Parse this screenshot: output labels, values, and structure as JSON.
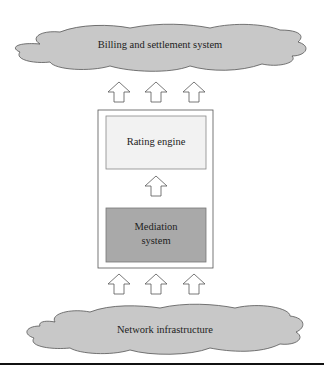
{
  "diagram": {
    "top_cloud": {
      "label": "Billing and settlement system",
      "fill": "#c8c8c8"
    },
    "rating_engine": {
      "label": "Rating engine",
      "fill": "#f2f2f2"
    },
    "mediation_system": {
      "label_line1": "Mediation",
      "label_line2": "system",
      "fill": "#a9a9a9"
    },
    "bottom_cloud": {
      "label": "Network infrastructure",
      "fill": "#c8c8c8"
    },
    "arrow_icon": "up-arrow-icon"
  }
}
